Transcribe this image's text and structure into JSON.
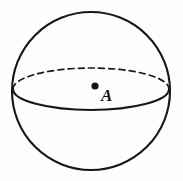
{
  "figure": {
    "kind": "geometry-diagram",
    "canvas": {
      "width": 183,
      "height": 181
    },
    "background_color": "#fdfdfc",
    "ink_color": "#161616"
  },
  "shapes": {
    "sphere_outline": {
      "name": "sphere-circle",
      "cx": 91,
      "cy": 91,
      "r": 79,
      "stroke_width": 2,
      "style": "solid"
    },
    "equator_back": {
      "name": "equator-dashed-back-half",
      "cx": 91,
      "cy": 89,
      "rx": 78,
      "ry": 21,
      "stroke_width": 1.8,
      "style": "dashed",
      "dash_pattern": "6 4"
    },
    "equator_front": {
      "name": "equator-solid-front-half",
      "cx": 91,
      "cy": 89,
      "rx": 78,
      "ry": 21,
      "stroke_width": 2,
      "style": "solid"
    }
  },
  "points": [
    {
      "id": "A",
      "label": "A",
      "dot_x": 95,
      "dot_y": 86,
      "dot_r": 3.5,
      "label_x": 101,
      "label_y": 101,
      "label_font_size": 17
    }
  ]
}
